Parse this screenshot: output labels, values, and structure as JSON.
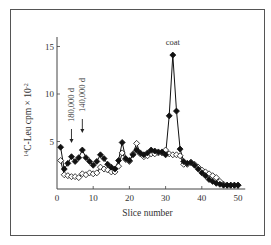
{
  "chart_data": {
    "type": "line",
    "title": "",
    "xlabel": "Slice number",
    "ylabel": "14C-Leu cpm × 10^-2",
    "ylabel_parts": {
      "sup1": "14",
      "main": "C-Leu cpm × 10",
      "sup2": "-2"
    },
    "xlim": [
      0,
      52
    ],
    "ylim": [
      0,
      16
    ],
    "xticks": [
      0,
      10,
      20,
      30,
      40,
      50
    ],
    "yticks": [
      5,
      10,
      15
    ],
    "grid": false,
    "legend": null,
    "x": [
      1,
      2,
      3,
      4,
      5,
      6,
      7,
      8,
      9,
      10,
      11,
      12,
      13,
      14,
      15,
      16,
      17,
      18,
      19,
      20,
      21,
      22,
      23,
      24,
      25,
      26,
      27,
      28,
      29,
      30,
      31,
      32,
      33,
      34,
      35,
      36,
      37,
      38,
      39,
      40,
      41,
      42,
      43,
      44,
      45,
      46,
      47,
      48,
      49,
      50
    ],
    "series": [
      {
        "name": "filled diamonds",
        "marker": "filled-diamond",
        "values": [
          4.4,
          2.1,
          2.7,
          3.4,
          2.9,
          3.3,
          4.1,
          3.3,
          2.9,
          2.5,
          2.9,
          3.6,
          3.2,
          2.6,
          2.3,
          2.1,
          3.0,
          4.9,
          3.2,
          3.0,
          3.6,
          4.1,
          3.8,
          3.6,
          3.8,
          4.1,
          4.0,
          3.9,
          3.9,
          3.6,
          7.7,
          14.1,
          8.2,
          4.2,
          2.9,
          2.7,
          2.8,
          2.5,
          2.1,
          1.7,
          1.4,
          1.0,
          0.8,
          0.6,
          0.5,
          0.4,
          0.4,
          0.4,
          0.4,
          0.4
        ]
      },
      {
        "name": "open diamonds",
        "marker": "open-diamond",
        "values": [
          3.0,
          1.5,
          1.4,
          1.3,
          1.3,
          1.2,
          1.6,
          1.5,
          1.7,
          1.6,
          1.7,
          2.3,
          2.1,
          2.0,
          1.8,
          1.8,
          2.4,
          3.8,
          3.1,
          2.9,
          3.7,
          4.8,
          3.7,
          3.4,
          3.5,
          3.7,
          3.7,
          3.8,
          3.8,
          4.1,
          3.7,
          3.6,
          3.6,
          3.5,
          2.6,
          2.6,
          2.8,
          2.6,
          2.3,
          2.0,
          1.8,
          1.6,
          1.4,
          1.2,
          0.8,
          0.5,
          0.4,
          0.4,
          0.4,
          0.4
        ]
      }
    ],
    "annotations": [
      {
        "text": "180,000 d",
        "x": 4,
        "type": "arrow-down",
        "rotated": true
      },
      {
        "text": "140,000 d",
        "x": 7,
        "type": "arrow-down",
        "rotated": true
      },
      {
        "text": "coat",
        "x": 32,
        "y": 15.2,
        "type": "label"
      }
    ]
  }
}
